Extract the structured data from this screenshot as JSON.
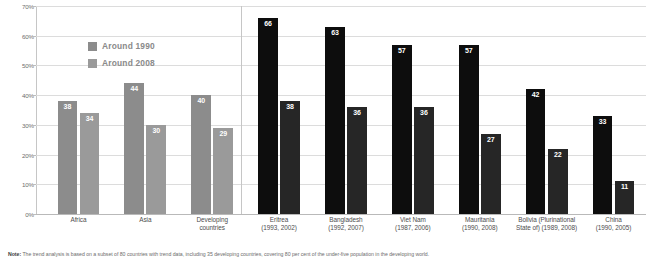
{
  "chart_data": {
    "type": "bar",
    "title": "",
    "subtitle": "",
    "xlabel": "",
    "ylabel": "",
    "ylim": [
      0,
      70
    ],
    "grid": true,
    "legend_position": "top-left-inside",
    "ytick_labels": [
      "0%",
      "10%",
      "20%",
      "30%",
      "40%",
      "50%",
      "60%",
      "70%"
    ],
    "ytick_values": [
      0,
      10,
      20,
      30,
      40,
      50,
      60,
      70
    ],
    "categories": [
      "Africa",
      "Asia",
      "Developing countries",
      "Eritrea",
      "Bangladesh",
      "Viet Nam",
      "Mauritania",
      "Bolivia (Plurinational State of)",
      "China"
    ],
    "category_labels": [
      {
        "name": "Africa",
        "years": "",
        "group": "region"
      },
      {
        "name": "Asia",
        "years": "",
        "group": "region"
      },
      {
        "name": "Developing",
        "years": "countries",
        "group": "region"
      },
      {
        "name": "Eritrea",
        "years": "(1993, 2002)",
        "group": "country"
      },
      {
        "name": "Bangladesh",
        "years": "(1992, 2007)",
        "group": "country"
      },
      {
        "name": "Viet Nam",
        "years": "(1987, 2006)",
        "group": "country"
      },
      {
        "name": "Mauritania",
        "years": "(1990, 2008)",
        "group": "country"
      },
      {
        "name": "Bolivia (Plurinational",
        "years": "State of) (1989, 2008)",
        "group": "country"
      },
      {
        "name": "China",
        "years": "(1990, 2005)",
        "group": "country"
      }
    ],
    "series": [
      {
        "name": "Around 1990",
        "values": [
          38,
          44,
          40,
          66,
          63,
          57,
          57,
          42,
          33
        ]
      },
      {
        "name": "Around 2008",
        "values": [
          34,
          30,
          29,
          38,
          36,
          36,
          27,
          22,
          11
        ]
      }
    ],
    "colors": {
      "region_series_1": "#8c8c8c",
      "region_series_2": "#9a9a9a",
      "country_series_1": "#0d0d0d",
      "country_series_2": "#262626",
      "gridline": "#dcdcdc",
      "axis": "#c6c6c6",
      "value_label": "#ffffff",
      "legend_text": "#8a8a8a"
    }
  },
  "legend": {
    "items": [
      {
        "label": "Around 1990",
        "swatch": "#8c8c8c"
      },
      {
        "label": "Around 2008",
        "swatch": "#9a9a9a"
      }
    ]
  },
  "footnote": {
    "prefix": "Note:",
    "text": "The trend analysis is based on a subset of 80 countries with trend data, including 35 developing countries, covering 80 per cent of the under-five population in the developing world."
  }
}
